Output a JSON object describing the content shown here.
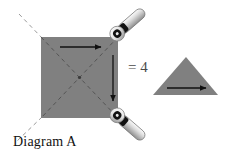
{
  "figure": {
    "caption": "Diagram A",
    "equivalence_label": "= 4",
    "background_color": "#ffffff"
  },
  "shapes": {
    "square": {
      "name": "shaded square",
      "fill_color": "#808080",
      "x": 41,
      "y": 37,
      "width": 77,
      "height": 81,
      "diagonals": "dashed",
      "diagonal_color": "#5a5a5a",
      "center_dot": true
    },
    "triangle": {
      "name": "shaded triangle",
      "fill_color": "#808080",
      "apex_x": 186,
      "apex_y": 57,
      "base_left_x": 153,
      "base_right_x": 218,
      "base_y": 95
    }
  },
  "arrows": {
    "square_top_arrow": {
      "direction": "right",
      "x1": 60,
      "y1": 47,
      "x2": 104,
      "y2": 47,
      "color": "#111111"
    },
    "square_right_arrow": {
      "direction": "down",
      "x1": 113,
      "y1": 55,
      "x2": 113,
      "y2": 104,
      "color": "#111111"
    },
    "triangle_arrow": {
      "direction": "right",
      "x1": 167,
      "y1": 88,
      "x2": 209,
      "y2": 88,
      "color": "#111111"
    }
  },
  "hinges": [
    {
      "name": "top-right-hinge",
      "pivot_x": 118,
      "pivot_y": 33,
      "angle_deg": -41,
      "bar_color": "#d0d0d0",
      "collar_color": "#111111",
      "ring_outer_color": "#f2f2f2",
      "ring_inner_color": "#111111"
    },
    {
      "name": "bottom-right-hinge",
      "pivot_x": 118,
      "pivot_y": 116,
      "angle_deg": 41,
      "bar_color": "#d0d0d0",
      "collar_color": "#111111",
      "ring_outer_color": "#f2f2f2",
      "ring_inner_color": "#111111"
    }
  ],
  "guide_lines": {
    "extended_diagonal_color": "#9a9a9a",
    "top_left_extension": {
      "x1": 19,
      "y1": 14,
      "x2": 41,
      "y2": 37
    },
    "bottom_left_extension": {
      "x1": 41,
      "y1": 118,
      "x2": 16,
      "y2": 142
    }
  }
}
